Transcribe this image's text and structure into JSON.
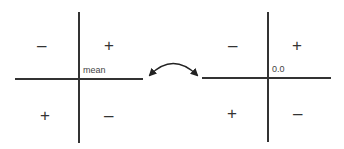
{
  "left_quadrant": {
    "origin_label": "mean",
    "top_left": "–",
    "top_right": "+",
    "bottom_left": "+",
    "bottom_right": "–"
  },
  "right_quadrant": {
    "origin_label": "0.0",
    "top_left": "–",
    "top_right": "+",
    "bottom_left": "+",
    "bottom_right": "–"
  },
  "connector": {
    "icon": "double-headed-curved-arrow",
    "color": "#222222"
  }
}
